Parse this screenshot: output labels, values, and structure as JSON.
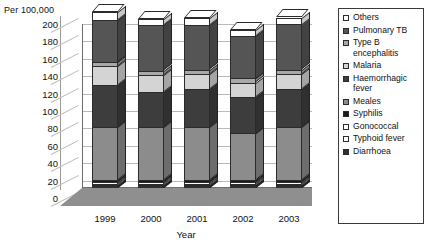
{
  "chart_data": {
    "type": "bar",
    "subtype": "stacked-column-3d",
    "title": "",
    "ylabel": "Per 100,000",
    "xlabel": "Year",
    "ylim": [
      0,
      200
    ],
    "ytick_step": 20,
    "yticks": [
      "200",
      "180",
      "160",
      "140",
      "120",
      "100",
      "80",
      "60",
      "40",
      "20",
      "0"
    ],
    "grid": true,
    "legend_position": "right",
    "categories": [
      "1999",
      "2000",
      "2001",
      "2002",
      "2003"
    ],
    "series": [
      {
        "name": "Diarrhoea",
        "color": "#2f2f2f",
        "values": [
          3,
          3,
          3,
          3,
          3
        ]
      },
      {
        "name": "Typhoid fever",
        "color": "#ffffff",
        "values": [
          2,
          2,
          2,
          2,
          2
        ]
      },
      {
        "name": "Gonococcal",
        "color": "#ffffff",
        "values": [
          2,
          2,
          2,
          2,
          2
        ]
      },
      {
        "name": "Syphilis",
        "color": "#1c1c1c",
        "values": [
          2,
          2,
          2,
          2,
          2
        ]
      },
      {
        "name": "Meales",
        "color": "#8c8c8c",
        "values": [
          61,
          61,
          61,
          54,
          61
        ]
      },
      {
        "name": "Haemorrhagic fever",
        "color": "#3d3d3d",
        "values": [
          48,
          40,
          44,
          42,
          44
        ]
      },
      {
        "name": "Malaria",
        "color": "#d4d4d4",
        "values": [
          22,
          20,
          17,
          16,
          17
        ]
      },
      {
        "name": "Type B encephalitis",
        "color": "#a8a8a8",
        "values": [
          5,
          5,
          5,
          5,
          5
        ]
      },
      {
        "name": "Pulmonary TB",
        "color": "#555555",
        "values": [
          48,
          52,
          51,
          49,
          52
        ]
      },
      {
        "name": "Others",
        "color": "#ffffff",
        "values": [
          9,
          7,
          8,
          7,
          8
        ]
      }
    ],
    "totals": [
      202,
      194,
      195,
      185,
      196
    ]
  },
  "legend": {
    "items": [
      {
        "label": "Others"
      },
      {
        "label": "Pulmonary TB"
      },
      {
        "label": "Type B encephalitis"
      },
      {
        "label": "Malaria"
      },
      {
        "label": "Haemorrhagic fever"
      },
      {
        "label": "Meales"
      },
      {
        "label": "Syphilis"
      },
      {
        "label": "Gonococcal"
      },
      {
        "label": "Typhoid fever"
      },
      {
        "label": "Diarrhoea"
      }
    ]
  }
}
